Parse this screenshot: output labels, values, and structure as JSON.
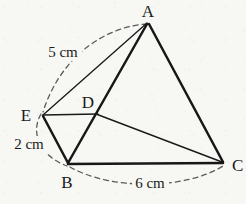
{
  "figure": {
    "background_color": "#f7f7f4",
    "stroke_color": "#1a1a1a",
    "dash_color": "#5a5a5a",
    "vertices": [
      {
        "id": "A",
        "label": "A",
        "x": 148,
        "y": 22,
        "label_x": 148,
        "label_y": 15
      },
      {
        "id": "B",
        "label": "B",
        "x": 68,
        "y": 164,
        "label_x": 67,
        "label_y": 185
      },
      {
        "id": "C",
        "label": "C",
        "x": 223,
        "y": 163,
        "label_x": 234,
        "label_y": 170
      },
      {
        "id": "D",
        "label": "D",
        "x": 97,
        "y": 114,
        "label_x": 88,
        "label_y": 106
      },
      {
        "id": "E",
        "label": "E",
        "x": 42,
        "y": 115,
        "label_x": 26,
        "label_y": 119
      }
    ],
    "segments": [
      {
        "id": "A-B",
        "from": "A",
        "to": "B",
        "weight": "thick"
      },
      {
        "id": "A-C",
        "from": "A",
        "to": "C",
        "weight": "thick"
      },
      {
        "id": "B-C",
        "from": "B",
        "to": "C",
        "weight": "thick"
      },
      {
        "id": "E-B",
        "from": "E",
        "to": "B",
        "weight": "thick"
      },
      {
        "id": "A-E",
        "from": "A",
        "to": "E",
        "weight": "thin"
      },
      {
        "id": "E-D",
        "from": "E",
        "to": "D",
        "weight": "thin"
      },
      {
        "id": "D-C",
        "from": "D",
        "to": "C",
        "weight": "thin"
      }
    ],
    "arcs": [
      {
        "id": "arc-AE",
        "from": "A",
        "to": "E",
        "measure_ref": "5cm"
      },
      {
        "id": "arc-EB",
        "from": "E",
        "to": "B",
        "measure_ref": "2cm"
      },
      {
        "id": "arc-BC",
        "from": "B",
        "to": "C",
        "measure_ref": "6cm"
      }
    ],
    "measurements": [
      {
        "id": "5cm",
        "value": "5",
        "unit": "cm",
        "text": "5 cm",
        "x": 63,
        "y": 55,
        "for_arc": "arc-AE"
      },
      {
        "id": "2cm",
        "value": "2",
        "unit": "cm",
        "text": "2 cm",
        "x": 29,
        "y": 147,
        "for_arc": "arc-EB"
      },
      {
        "id": "6cm",
        "value": "6",
        "unit": "cm",
        "text": "6 cm",
        "x": 150,
        "y": 186,
        "for_arc": "arc-BC"
      }
    ]
  }
}
